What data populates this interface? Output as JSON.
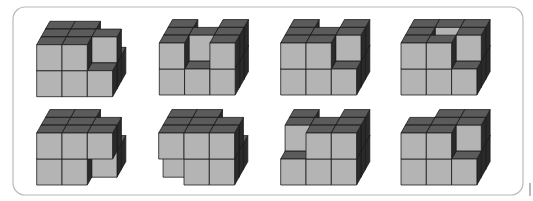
{
  "frame": {
    "x": 13,
    "y": 7,
    "width": 510,
    "height": 188,
    "radius": 12
  },
  "edge_mark": {
    "x": 530,
    "y1": 183,
    "y2": 196
  },
  "projection": {
    "cell_width": 25.3,
    "cell_height": 26,
    "depth_dx": 4.4,
    "depth_dy": 7.8
  },
  "colors": {
    "front": "#b4b4b4",
    "top": "#5b5b5b",
    "side": "#2a2a2a",
    "edge": "#1c1c1c"
  },
  "figures": [
    {
      "id": 1,
      "origin": [
        36.7,
        96.7
      ],
      "bottom": [
        [
          0,
          0
        ],
        [
          0,
          1
        ],
        [
          0,
          2
        ],
        [
          1,
          0
        ],
        [
          1,
          1
        ],
        [
          1,
          2
        ],
        [
          2,
          0
        ],
        [
          2,
          1
        ],
        [
          2,
          2
        ]
      ],
      "top": [
        [
          0,
          0
        ],
        [
          0,
          1
        ],
        [
          0,
          2
        ],
        [
          1,
          0
        ],
        [
          1,
          1
        ],
        [
          1,
          2
        ],
        [
          2,
          1
        ]
      ]
    },
    {
      "id": 2,
      "origin": [
        159.3,
        95
      ],
      "bottom": [
        [
          0,
          0
        ],
        [
          0,
          1
        ],
        [
          0,
          2
        ],
        [
          1,
          0
        ],
        [
          1,
          1
        ],
        [
          1,
          2
        ],
        [
          2,
          0
        ],
        [
          2,
          1
        ],
        [
          2,
          2
        ]
      ],
      "top": [
        [
          0,
          0
        ],
        [
          0,
          1
        ],
        [
          0,
          2
        ],
        [
          1,
          1
        ],
        [
          2,
          0
        ],
        [
          2,
          1
        ],
        [
          2,
          2
        ]
      ]
    },
    {
      "id": 3,
      "origin": [
        280.7,
        95
      ],
      "bottom": [
        [
          0,
          0
        ],
        [
          0,
          1
        ],
        [
          0,
          2
        ],
        [
          1,
          0
        ],
        [
          1,
          1
        ],
        [
          1,
          2
        ],
        [
          2,
          0
        ],
        [
          2,
          1
        ],
        [
          2,
          2
        ]
      ],
      "top": [
        [
          0,
          0
        ],
        [
          0,
          1
        ],
        [
          0,
          2
        ],
        [
          1,
          0
        ],
        [
          1,
          1
        ],
        [
          2,
          1
        ],
        [
          2,
          2
        ]
      ]
    },
    {
      "id": 4,
      "origin": [
        401,
        95
      ],
      "bottom": [
        [
          0,
          0
        ],
        [
          0,
          1
        ],
        [
          0,
          2
        ],
        [
          1,
          0
        ],
        [
          1,
          1
        ],
        [
          1,
          2
        ],
        [
          2,
          0
        ],
        [
          2,
          1
        ],
        [
          2,
          2
        ]
      ],
      "top": [
        [
          0,
          0
        ],
        [
          0,
          1
        ],
        [
          0,
          2
        ],
        [
          1,
          0
        ],
        [
          1,
          2
        ],
        [
          2,
          1
        ],
        [
          2,
          2
        ]
      ]
    },
    {
      "id": 5,
      "origin": [
        36.7,
        185
      ],
      "bottom": [
        [
          0,
          0
        ],
        [
          0,
          1
        ],
        [
          0,
          2
        ],
        [
          1,
          0
        ],
        [
          1,
          1
        ],
        [
          1,
          2
        ],
        [
          2,
          1
        ],
        [
          2,
          2
        ]
      ],
      "top": [
        [
          0,
          0
        ],
        [
          0,
          1
        ],
        [
          0,
          2
        ],
        [
          1,
          0
        ],
        [
          1,
          1
        ],
        [
          1,
          2
        ],
        [
          2,
          0
        ],
        [
          2,
          1
        ]
      ]
    },
    {
      "id": 6,
      "origin": [
        158.7,
        185
      ],
      "bottom": [
        [
          0,
          1
        ],
        [
          0,
          2
        ],
        [
          1,
          0
        ],
        [
          1,
          1
        ],
        [
          1,
          2
        ],
        [
          2,
          0
        ],
        [
          2,
          1
        ],
        [
          2,
          2
        ]
      ],
      "top": [
        [
          0,
          0
        ],
        [
          0,
          1
        ],
        [
          0,
          2
        ],
        [
          1,
          0
        ],
        [
          1,
          1
        ],
        [
          1,
          2
        ],
        [
          2,
          0
        ],
        [
          2,
          1
        ]
      ]
    },
    {
      "id": 7,
      "origin": [
        280.7,
        185
      ],
      "bottom": [
        [
          0,
          0
        ],
        [
          0,
          1
        ],
        [
          0,
          2
        ],
        [
          1,
          0
        ],
        [
          1,
          1
        ],
        [
          1,
          2
        ],
        [
          2,
          0
        ],
        [
          2,
          1
        ],
        [
          2,
          2
        ]
      ],
      "top": [
        [
          0,
          1
        ],
        [
          0,
          2
        ],
        [
          1,
          0
        ],
        [
          1,
          1
        ],
        [
          2,
          0
        ],
        [
          2,
          1
        ],
        [
          2,
          2
        ]
      ]
    },
    {
      "id": 8,
      "origin": [
        401,
        185
      ],
      "bottom": [
        [
          0,
          0
        ],
        [
          0,
          1
        ],
        [
          0,
          2
        ],
        [
          1,
          0
        ],
        [
          1,
          1
        ],
        [
          1,
          2
        ],
        [
          2,
          0
        ],
        [
          2,
          1
        ],
        [
          2,
          2
        ]
      ],
      "top": [
        [
          0,
          0
        ],
        [
          0,
          1
        ],
        [
          1,
          0
        ],
        [
          1,
          1
        ],
        [
          1,
          2
        ],
        [
          2,
          1
        ],
        [
          2,
          2
        ]
      ]
    }
  ]
}
